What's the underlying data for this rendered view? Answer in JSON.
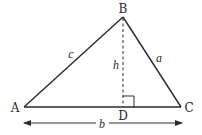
{
  "diagram": {
    "colors": {
      "stroke": "#2a2a2a",
      "background": "#ffffff"
    },
    "vertices": {
      "A": {
        "label": "A",
        "x": 24,
        "y": 107
      },
      "B": {
        "label": "B",
        "x": 123,
        "y": 17
      },
      "C": {
        "label": "C",
        "x": 181,
        "y": 107
      },
      "D": {
        "label": "D",
        "x": 123,
        "y": 107
      }
    },
    "sides": {
      "a": {
        "label": "a",
        "from": "B",
        "to": "C"
      },
      "b": {
        "label": "b",
        "from": "A",
        "to": "C"
      },
      "c": {
        "label": "c",
        "from": "A",
        "to": "B"
      }
    },
    "altitude": {
      "label": "h",
      "from": "B",
      "to": "D",
      "style": "dashed"
    },
    "right_angle_marker": {
      "at": "D",
      "size": 11
    },
    "dimension_arrow": {
      "label": "b",
      "from_x": 24,
      "to_x": 182,
      "y": 123,
      "double_headed": true
    }
  }
}
